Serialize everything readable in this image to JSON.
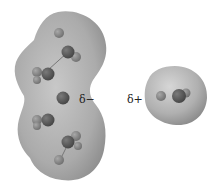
{
  "diagram": {
    "type": "electrostatic-potential-surfaces",
    "left_molecule": {
      "description": "large elongated molecule with electron density surface",
      "partial_charge_label": "δ−"
    },
    "right_molecule": {
      "description": "small diatomic molecule with electron density surface",
      "partial_charge_label": "δ+"
    },
    "colors": {
      "surface": "#a9a9a9",
      "surface_light": "#cfcfcf",
      "atom_dark": "#5a5a5a",
      "atom_light": "#8c8c8c",
      "background": "#ffffff"
    }
  }
}
